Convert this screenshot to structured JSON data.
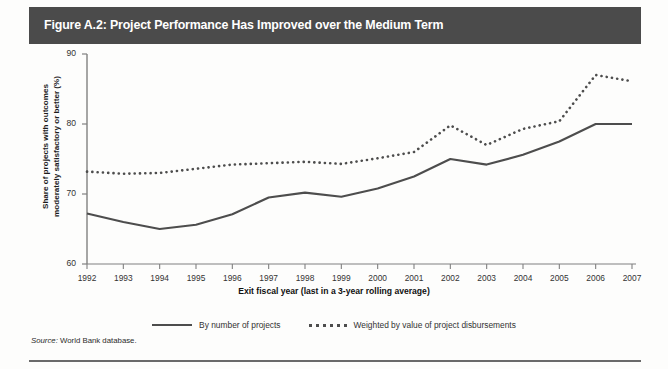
{
  "figure": {
    "title": "Figure A.2: Project Performance Has Improved over the Medium Term",
    "source_prefix": "Source:",
    "source_text": " World Bank database."
  },
  "chart_data": {
    "type": "line",
    "title": "Figure A.2: Project Performance Has Improved over the Medium Term",
    "xlabel": "Exit fiscal year (last in a 3-year rolling average)",
    "ylabel": "Share of projects with outcomes moderately satisfactory or better (%)",
    "xlim": [
      1992,
      2007
    ],
    "ylim": [
      60,
      90
    ],
    "yticks": [
      60,
      70,
      80,
      90
    ],
    "grid": false,
    "legend_position": "bottom",
    "categories": [
      "1992",
      "1993",
      "1994",
      "1995",
      "1996",
      "1997",
      "1998",
      "1999",
      "2000",
      "2001",
      "2002",
      "2003",
      "2004",
      "2005",
      "2006",
      "2007"
    ],
    "series": [
      {
        "name": "By number of projects",
        "style": "solid",
        "color": "#4d4d4d",
        "values": [
          67.2,
          66.0,
          65.0,
          65.6,
          67.1,
          69.5,
          70.2,
          69.6,
          70.8,
          72.5,
          75.0,
          74.2,
          75.6,
          77.5,
          80.0,
          80.0
        ]
      },
      {
        "name": "Weighted by value of project disbursements",
        "style": "dotted",
        "color": "#4d4d4d",
        "values": [
          73.2,
          72.9,
          73.0,
          73.6,
          74.2,
          74.4,
          74.6,
          74.3,
          75.1,
          76.0,
          79.8,
          77.0,
          79.3,
          80.4,
          87.0,
          86.1
        ]
      }
    ]
  },
  "axis": {
    "ylabel_line1": "Share of projects with outcomes",
    "ylabel_line2": "moderately satisfactory or better (%)",
    "xlabel": "Exit fiscal year (last in a 3-year rolling average)"
  },
  "legend": {
    "items": [
      {
        "label": "By number of projects",
        "style": "solid"
      },
      {
        "label": "Weighted by value of project disbursements",
        "style": "dotted"
      }
    ]
  }
}
